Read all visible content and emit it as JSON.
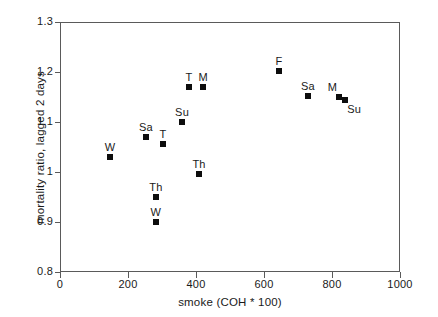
{
  "chart_data": {
    "type": "scatter",
    "title": "",
    "xlabel": "smoke (COH * 100)",
    "ylabel": "mortality ratio, lagged 2 days",
    "xlim": [
      0,
      1000
    ],
    "ylim": [
      0.8,
      1.3
    ],
    "xticks": [
      "0",
      "200",
      "400",
      "600",
      "800",
      "1000"
    ],
    "xtick_values": [
      0,
      200,
      400,
      600,
      800,
      1000
    ],
    "yticks": [
      "0.8",
      "0.9",
      "1",
      "1.1",
      "1.2",
      "1.3"
    ],
    "ytick_values": [
      0.8,
      0.9,
      1.0,
      1.1,
      1.2,
      1.3
    ],
    "grid": false,
    "legend": "none",
    "marker_color": "#0d0d0d",
    "marker_shape": "square",
    "points": [
      {
        "label": "W",
        "x": 147,
        "y": 1.03,
        "label_pos": "above"
      },
      {
        "label": "Sa",
        "x": 253,
        "y": 1.07,
        "label_pos": "above"
      },
      {
        "label": "T",
        "x": 303,
        "y": 1.057,
        "label_pos": "above"
      },
      {
        "label": "Th",
        "x": 282,
        "y": 0.951,
        "label_pos": "above"
      },
      {
        "label": "W",
        "x": 282,
        "y": 0.901,
        "label_pos": "above"
      },
      {
        "label": "Su",
        "x": 359,
        "y": 1.101,
        "label_pos": "above"
      },
      {
        "label": "T",
        "x": 379,
        "y": 1.17,
        "label_pos": "above"
      },
      {
        "label": "M",
        "x": 421,
        "y": 1.17,
        "label_pos": "above"
      },
      {
        "label": "Th",
        "x": 409,
        "y": 0.996,
        "label_pos": "above"
      },
      {
        "label": "F",
        "x": 644,
        "y": 1.203,
        "label_pos": "above"
      },
      {
        "label": "Sa",
        "x": 729,
        "y": 1.152,
        "label_pos": "above"
      },
      {
        "label": "M",
        "x": 821,
        "y": 1.15,
        "label_pos": "above-left"
      },
      {
        "label": "Su",
        "x": 839,
        "y": 1.144,
        "label_pos": "below-right"
      }
    ]
  }
}
